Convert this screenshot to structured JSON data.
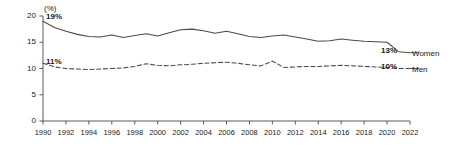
{
  "chart_data": {
    "type": "line",
    "title": "",
    "subtitle": "",
    "xlabel": "",
    "ylabel": "",
    "unit_label": "(%)",
    "x": [
      1990,
      1991,
      1992,
      1993,
      1994,
      1995,
      1996,
      1997,
      1998,
      1999,
      2000,
      2001,
      2002,
      2003,
      2004,
      2005,
      2006,
      2007,
      2008,
      2009,
      2010,
      2011,
      2012,
      2013,
      2014,
      2015,
      2016,
      2017,
      2018,
      2019,
      2020,
      2021,
      2022
    ],
    "xlim": [
      1990,
      2022
    ],
    "ylim": [
      0,
      20
    ],
    "yticks": [
      0,
      5,
      10,
      15,
      20
    ],
    "xticks": [
      1990,
      1992,
      1994,
      1996,
      1998,
      2000,
      2002,
      2004,
      2006,
      2008,
      2010,
      2012,
      2014,
      2016,
      2018,
      2020,
      2022
    ],
    "xtick_labels": [
      "1990",
      "1992",
      "1994",
      "1996",
      "1998",
      "2000",
      "2002",
      "2004",
      "2006",
      "2008",
      "2010",
      "2012",
      "2014",
      "2016",
      "2018",
      "2020",
      "2022"
    ],
    "ytick_labels": [
      "0",
      "5",
      "10",
      "15",
      "20"
    ],
    "grid": false,
    "legend_position": "right-end-of-line",
    "series": [
      {
        "name": "Women",
        "style": "solid",
        "color": "#4a4a4a",
        "start_label": "19%",
        "end_label": "13%",
        "values": [
          19.0,
          17.8,
          17.1,
          16.5,
          16.1,
          16.0,
          16.4,
          15.9,
          16.3,
          16.6,
          16.2,
          16.8,
          17.4,
          17.5,
          17.2,
          16.7,
          17.1,
          16.6,
          16.1,
          15.9,
          16.2,
          16.4,
          16.0,
          15.6,
          15.2,
          15.3,
          15.6,
          15.4,
          15.2,
          15.1,
          15.0,
          13.2,
          13.0
        ]
      },
      {
        "name": "Men",
        "style": "dashed",
        "color": "#4a4a4a",
        "start_label": "11%",
        "end_label": "10%",
        "values": [
          11.0,
          10.3,
          10.0,
          9.9,
          9.8,
          9.9,
          10.0,
          10.1,
          10.4,
          10.9,
          10.6,
          10.5,
          10.7,
          10.8,
          11.0,
          11.1,
          11.2,
          11.0,
          10.7,
          10.5,
          11.4,
          10.2,
          10.3,
          10.4,
          10.4,
          10.5,
          10.6,
          10.5,
          10.4,
          10.3,
          10.2,
          10.0,
          10.0
        ]
      }
    ],
    "annotations": [
      {
        "text": "19%",
        "series": "Women",
        "position": "start"
      },
      {
        "text": "11%",
        "series": "Men",
        "position": "start"
      },
      {
        "text": "13%",
        "series": "Women",
        "position": "end"
      },
      {
        "text": "10%",
        "series": "Men",
        "position": "end"
      }
    ]
  }
}
